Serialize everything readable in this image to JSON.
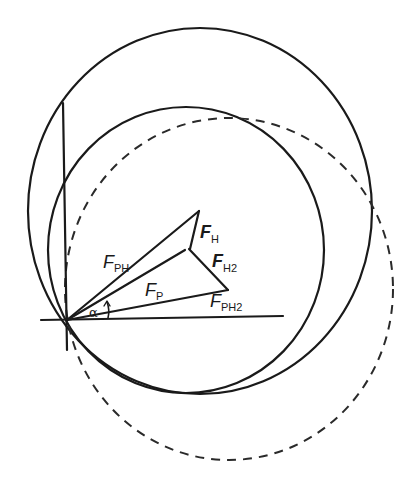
{
  "diagram": {
    "type": "vector force diagram with circles",
    "labels": {
      "f_ph": {
        "main": "F",
        "sub": "PH"
      },
      "f_h": {
        "main": "F",
        "sub": "H"
      },
      "f_h2": {
        "main": "F",
        "sub": "H2"
      },
      "f_p": {
        "main": "F",
        "sub": "P"
      },
      "f_ph2": {
        "main": "F",
        "sub": "PH2"
      },
      "alpha": "α"
    },
    "elements": [
      "large solid circle",
      "medium solid circle",
      "dashed circle",
      "horizontal axis",
      "vertical axis",
      "vector F_PH from origin",
      "vector F_P from origin",
      "vector F_PH2 from origin",
      "segment F_H",
      "segment F_H2",
      "angle arc alpha"
    ],
    "colors": {
      "line": "#1a1a1a",
      "background": "#ffffff"
    }
  }
}
